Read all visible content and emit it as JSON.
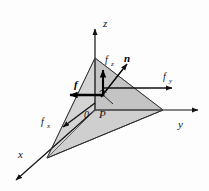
{
  "figure": {
    "type": "3d-line-diagram",
    "background_color": "#fdfdfd",
    "ink_color": "#111111",
    "faces": {
      "inclined_face_color": "#cfcfcf",
      "bottom_face_color": "#000000",
      "vertical_face_color": "#b4b4b4"
    }
  },
  "axes": {
    "z": {
      "label": "z",
      "direction": "up"
    },
    "y": {
      "label": "y",
      "direction": "right"
    },
    "x": {
      "label": "x",
      "direction": "down-left"
    }
  },
  "points": {
    "origin": {
      "label": "0"
    },
    "p": {
      "label": "P"
    }
  },
  "vectors": {
    "traction": {
      "label": "f",
      "bold": true,
      "direction": "left"
    },
    "normal": {
      "label": "n",
      "bold": true,
      "direction": "up-right"
    },
    "fz": {
      "label": "f",
      "sub": "z",
      "direction": "up"
    },
    "fy": {
      "label": "f",
      "sub": "y",
      "direction": "right"
    },
    "fx": {
      "label": "f",
      "sub": "x",
      "direction": "down-left"
    }
  }
}
